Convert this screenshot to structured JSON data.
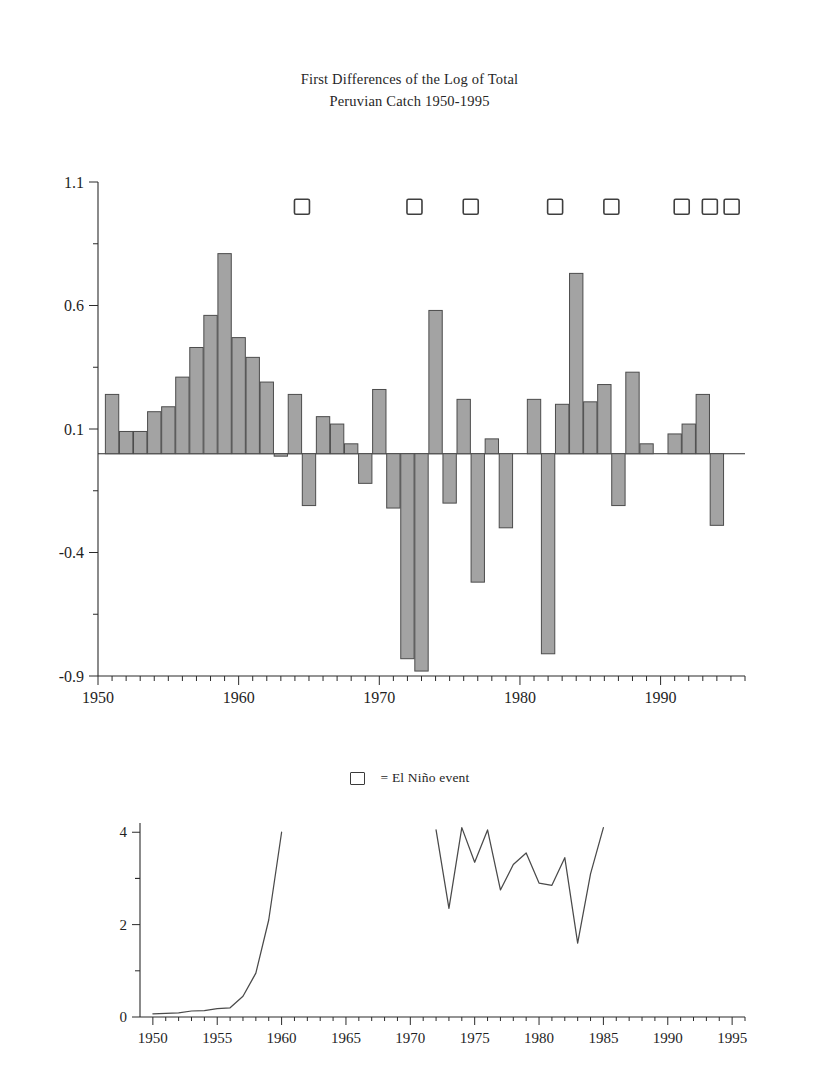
{
  "figure": {
    "title_lines": [
      "First Differences of the Log of Total",
      "Peruvian Catch 1950-1995"
    ]
  },
  "legend": {
    "marker_name": "el-nino-square",
    "text": "= El Niño event"
  },
  "colors": {
    "bar_fill": "#a3a3a3",
    "bar_stroke": "#4c4c4c",
    "axis": "#2b2b2b",
    "line": "#4a4a4a",
    "background": "#ffffff"
  },
  "chart_data": [
    {
      "id": "main-bar-chart",
      "type": "bar",
      "title": "First Differences of the Log of Total Peruvian Catch 1950-1995",
      "xlabel": "",
      "ylabel": "",
      "xlim": [
        1950,
        1996
      ],
      "ylim": [
        -0.9,
        1.1
      ],
      "ytick_labels": [
        "1.1",
        "0.6",
        "0.1",
        "-0.4",
        "-0.9"
      ],
      "ytick_values": [
        1.1,
        0.6,
        0.1,
        -0.4,
        -0.9
      ],
      "yminor_step": 0.25,
      "xtick_labels": [
        "1950",
        "1960",
        "1970",
        "1980",
        "1990"
      ],
      "xtick_values": [
        1950,
        1960,
        1970,
        1980,
        1990
      ],
      "xminor_step": 1,
      "grid": false,
      "legend_position": "below-axes",
      "categories": [
        1951,
        1952,
        1953,
        1954,
        1955,
        1956,
        1957,
        1958,
        1959,
        1960,
        1961,
        1962,
        1963,
        1964,
        1965,
        1966,
        1967,
        1968,
        1969,
        1970,
        1971,
        1972,
        1973,
        1974,
        1975,
        1976,
        1977,
        1978,
        1979,
        1980,
        1981,
        1982,
        1983,
        1984,
        1985,
        1986,
        1987,
        1988,
        1989,
        1990,
        1991,
        1992,
        1993,
        1994,
        1995
      ],
      "values": [
        0.24,
        0.09,
        0.09,
        0.17,
        0.19,
        0.31,
        0.43,
        0.56,
        0.81,
        0.47,
        0.39,
        0.29,
        -0.01,
        0.24,
        -0.21,
        0.15,
        0.12,
        0.04,
        -0.12,
        0.26,
        -0.22,
        -0.83,
        -0.88,
        0.58,
        -0.2,
        0.22,
        -0.52,
        0.06,
        -0.3,
        0.0,
        0.22,
        -0.81,
        0.2,
        0.73,
        0.21,
        0.28,
        -0.21,
        0.33,
        0.04,
        0.0,
        0.08,
        0.12,
        0.24,
        -0.29,
        0.0
      ],
      "annotations": {
        "el_nino_years": [
          1964,
          1972,
          1976,
          1982,
          1986,
          1991,
          1993
        ],
        "el_nino_marker_y": 1.0,
        "el_nino_marker_count": 8
      }
    },
    {
      "id": "lower-line-chart",
      "type": "line",
      "title": "",
      "xlabel": "",
      "ylabel": "",
      "xlim": [
        1949,
        1996
      ],
      "ylim": [
        0,
        4.2
      ],
      "ytick_labels": [
        "0",
        "2",
        "4"
      ],
      "ytick_values": [
        0,
        2,
        4
      ],
      "yminor_step": 1,
      "xtick_labels": [
        "1950",
        "1955",
        "1960",
        "1965",
        "1970",
        "1975",
        "1980",
        "1985",
        "1990",
        "1995"
      ],
      "xtick_values": [
        1950,
        1955,
        1960,
        1965,
        1970,
        1975,
        1980,
        1985,
        1990,
        1995
      ],
      "xminor_step": 1,
      "grid": false,
      "series": [
        {
          "name": "segment-early",
          "x": [
            1950,
            1951,
            1952,
            1953,
            1954,
            1955,
            1956,
            1957,
            1958,
            1959,
            1960
          ],
          "values": [
            0.07,
            0.08,
            0.09,
            0.13,
            0.14,
            0.18,
            0.2,
            0.45,
            0.95,
            2.1,
            4.0
          ]
        },
        {
          "name": "segment-late",
          "x": [
            1972,
            1973,
            1974,
            1975,
            1976,
            1977,
            1978,
            1979,
            1980,
            1981,
            1982,
            1983,
            1984,
            1985
          ],
          "values": [
            4.05,
            2.35,
            4.1,
            3.35,
            4.05,
            2.75,
            3.3,
            3.55,
            2.9,
            2.85,
            3.45,
            1.6,
            3.1,
            4.1
          ]
        }
      ]
    }
  ]
}
